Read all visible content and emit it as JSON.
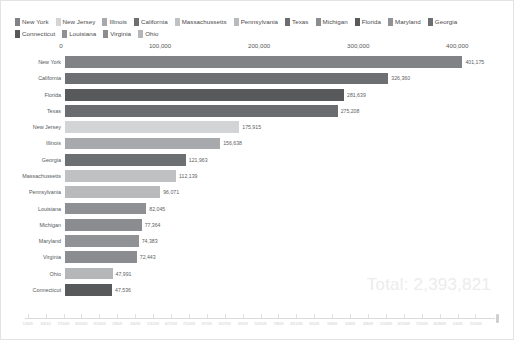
{
  "chart_data": {
    "type": "bar",
    "orientation": "horizontal",
    "title": "",
    "xlabel": "",
    "ylabel": "",
    "xlim": [
      0,
      430000
    ],
    "grid": false,
    "legend_position": "top",
    "categories": [
      "New York",
      "California",
      "Florida",
      "Texas",
      "New Jersey",
      "Illinois",
      "Georgia",
      "Massachussetts",
      "Pennsylvania",
      "Louisiana",
      "Michigan",
      "Maryland",
      "Virginia",
      "Ohio",
      "Connecticut"
    ],
    "values": [
      401175,
      326360,
      281639,
      275208,
      175915,
      156638,
      121963,
      112139,
      96071,
      82045,
      77364,
      74383,
      72443,
      47991,
      47536
    ],
    "value_labels": [
      "401,175",
      "326,360",
      "281,639",
      "275,208",
      "175,915",
      "156,638",
      "121,963",
      "112,139",
      "96,071",
      "82,045",
      "77,364",
      "74,383",
      "72,443",
      "47,991",
      "47,536"
    ],
    "bar_colors": [
      "#808285",
      "#6d7073",
      "#58595b",
      "#6a6c6f",
      "#d3d4d5",
      "#a7a9ac",
      "#6d7073",
      "#c0c1c3",
      "#b8babc",
      "#8e9093",
      "#8a8c8f",
      "#909295",
      "#8a8c8f",
      "#b4b6b8",
      "#58595b"
    ],
    "xticks": [
      0,
      100000,
      200000,
      300000,
      400000
    ],
    "xtick_labels": [
      "0",
      "100,000",
      "200,000",
      "300,000",
      "400,000"
    ],
    "annotations": [
      {
        "name": "total",
        "text": "Total: 2,393,821",
        "value": 2393821
      }
    ]
  },
  "legend": {
    "items": [
      {
        "label": "New York",
        "color": "#808285"
      },
      {
        "label": "New Jersey",
        "color": "#d3d4d5"
      },
      {
        "label": "Illinois",
        "color": "#a7a9ac"
      },
      {
        "label": "California",
        "color": "#6d7073"
      },
      {
        "label": "Massachussetts",
        "color": "#c0c1c3"
      },
      {
        "label": "Pennsylvania",
        "color": "#b8babc"
      },
      {
        "label": "Texas",
        "color": "#6a6c6f"
      },
      {
        "label": "Michigan",
        "color": "#8a8c8f"
      },
      {
        "label": "Florida",
        "color": "#58595b"
      },
      {
        "label": "Maryland",
        "color": "#909295"
      },
      {
        "label": "Georgia",
        "color": "#6d7073"
      },
      {
        "label": "Connecticut",
        "color": "#58595b"
      },
      {
        "label": "Louisiana",
        "color": "#8e9093"
      },
      {
        "label": "Virginia",
        "color": "#8a8c8f"
      },
      {
        "label": "Ohio",
        "color": "#b4b6b8"
      }
    ]
  },
  "timeline": {
    "tick_labels": [
      "1/3/09",
      "6/6/10",
      "7/15/09",
      "8/20/09",
      "9/24/09",
      "2/8/09",
      "4/6/09",
      "5/11/09",
      "6/17/09",
      "7/22/09",
      "9/7/09",
      "9/27/09",
      "3/5/09",
      "5/25/09",
      "7/8/09",
      "8/12/09",
      "9/5/09",
      "9/8/09",
      "3/4/09",
      "4/8/09",
      "5/13/09",
      "6/19/09",
      "7/25/09",
      "8/28/09",
      "1/4/09",
      "7/10/09"
    ]
  }
}
